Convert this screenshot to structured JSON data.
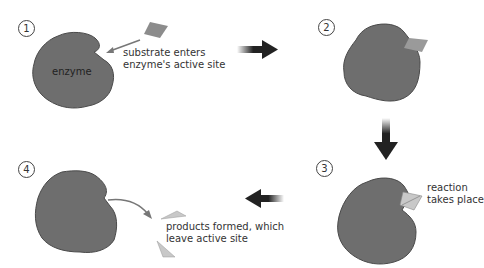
{
  "colors": {
    "enzyme": "#6e6e6e",
    "enzyme_outline": "#4a4a4a",
    "substrate": "#8c8c8c",
    "product": "#c8c8c8",
    "arrow": "#222222",
    "background": "#ffffff"
  },
  "steps": [
    {
      "number": "1",
      "label": "substrate enters\nenzyme's active site",
      "label_line1": "substrate enters",
      "label_line2": "enzyme's active site",
      "enzyme_label": "enzyme"
    },
    {
      "number": "2"
    },
    {
      "number": "3",
      "label_line1": "reaction",
      "label_line2": "takes place"
    },
    {
      "number": "4",
      "label_line1": "products formed, which",
      "label_line2": "leave active site"
    }
  ],
  "flow_arrows": [
    {
      "from": "1",
      "to": "2",
      "direction": "right"
    },
    {
      "from": "2",
      "to": "3",
      "direction": "down"
    },
    {
      "from": "3",
      "to": "4",
      "direction": "left"
    }
  ]
}
